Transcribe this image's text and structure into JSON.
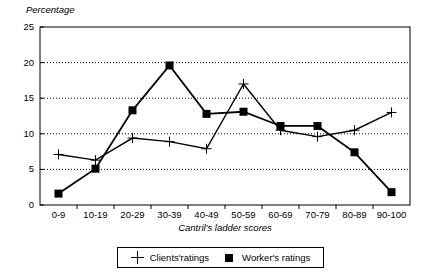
{
  "chart_data": {
    "type": "line",
    "title": "",
    "xlabel": "Cantril's ladder scores",
    "ylabel": "Percentage",
    "categories": [
      "0-9",
      "10-19",
      "20-29",
      "30-39",
      "40-49",
      "50-59",
      "60-69",
      "70-79",
      "80-89",
      "90-100"
    ],
    "ylim": [
      0,
      25
    ],
    "yticks": [
      0,
      5,
      10,
      15,
      20,
      25
    ],
    "grid": "horizontal-dotted",
    "legend_position": "bottom-center",
    "series": [
      {
        "name": "Clients'ratings",
        "marker": "cross",
        "values": [
          7.1,
          6.3,
          9.4,
          8.9,
          7.9,
          17.0,
          10.5,
          9.6,
          10.5,
          13.0
        ]
      },
      {
        "name": "Worker's ratings",
        "marker": "square",
        "values": [
          1.6,
          5.1,
          13.3,
          19.6,
          12.8,
          13.1,
          11.1,
          11.1,
          7.4,
          1.8
        ]
      }
    ]
  },
  "style": {
    "line_color": "#000000",
    "grid_color": "#000000",
    "axis_color": "#000000",
    "background": "#ffffff"
  },
  "legend": {
    "entries": [
      {
        "label": "Clients'ratings",
        "marker": "cross"
      },
      {
        "label": "Worker's ratings",
        "marker": "square"
      }
    ]
  }
}
